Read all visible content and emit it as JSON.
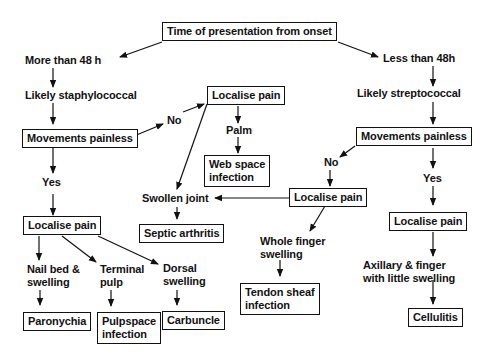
{
  "diagram": {
    "type": "flowchart",
    "title": "Time of presentation from onset",
    "colors": {
      "stroke": "#111111",
      "background": "#ffffff",
      "text": "#111111"
    },
    "nodes": {
      "root": {
        "text": "Time of presentation from onset",
        "boxed": true
      },
      "more48": {
        "text": "More than 48 h",
        "boxed": false
      },
      "staph": {
        "text": "Likely staphylococcal",
        "boxed": false
      },
      "mov_left": {
        "text": "Movements painless",
        "boxed": true
      },
      "no_left": {
        "text": "No",
        "boxed": false
      },
      "loc_mid": {
        "text": "Localise pain",
        "boxed": true
      },
      "palm": {
        "text": "Palm",
        "boxed": false
      },
      "webspace": {
        "line1": "Web space",
        "line2": "infection",
        "boxed": true
      },
      "yes_left": {
        "text": "Yes",
        "boxed": false
      },
      "loc_left": {
        "text": "Localise pain",
        "boxed": true
      },
      "swollen": {
        "text": "Swollen joint",
        "boxed": false
      },
      "septic": {
        "text": "Septic arthritis",
        "boxed": true
      },
      "nailbed": {
        "line1": "Nail bed &",
        "line2": "swelling",
        "boxed": false
      },
      "terminal": {
        "line1": "Terminal",
        "line2": "pulp",
        "boxed": false
      },
      "dorsal": {
        "line1": "Dorsal",
        "line2": "swelling",
        "boxed": false
      },
      "paronychia": {
        "text": "Paronychia",
        "boxed": true
      },
      "pulpspace": {
        "line1": "Pulpspace",
        "line2": "infection",
        "boxed": true
      },
      "carbuncle": {
        "text": "Carbuncle",
        "boxed": true
      },
      "less48": {
        "text": "Less than 48h",
        "boxed": false
      },
      "strep": {
        "text": "Likely streptococcal",
        "boxed": false
      },
      "mov_right": {
        "text": "Movements painless",
        "boxed": true
      },
      "no_right": {
        "text": "No",
        "boxed": false
      },
      "yes_right": {
        "text": "Yes",
        "boxed": false
      },
      "loc_center": {
        "text": "Localise pain",
        "boxed": true
      },
      "wholefinger": {
        "line1": "Whole finger",
        "line2": "swelling",
        "boxed": false
      },
      "tendon": {
        "line1": "Tendon sheaf",
        "line2": "infection",
        "boxed": true
      },
      "loc_right": {
        "text": "Localise pain",
        "boxed": true
      },
      "axillary": {
        "line1": "Axillary & finger",
        "line2": "with little swelling",
        "boxed": false
      },
      "cellulitis": {
        "text": "Cellulitis",
        "boxed": true
      }
    },
    "edges": [
      [
        "root",
        "more48"
      ],
      [
        "root",
        "less48"
      ],
      [
        "more48",
        "staph"
      ],
      [
        "staph",
        "mov_left"
      ],
      [
        "mov_left",
        "no_left"
      ],
      [
        "no_left",
        "loc_mid"
      ],
      [
        "loc_mid",
        "palm"
      ],
      [
        "palm",
        "webspace"
      ],
      [
        "loc_mid",
        "swollen"
      ],
      [
        "mov_left",
        "yes_left"
      ],
      [
        "yes_left",
        "loc_left"
      ],
      [
        "loc_left",
        "nailbed"
      ],
      [
        "loc_left",
        "terminal"
      ],
      [
        "loc_left",
        "dorsal"
      ],
      [
        "nailbed",
        "paronychia"
      ],
      [
        "terminal",
        "pulpspace"
      ],
      [
        "dorsal",
        "carbuncle"
      ],
      [
        "swollen",
        "septic"
      ],
      [
        "less48",
        "strep"
      ],
      [
        "strep",
        "mov_right"
      ],
      [
        "mov_right",
        "no_right"
      ],
      [
        "no_right",
        "loc_center"
      ],
      [
        "loc_center",
        "swollen"
      ],
      [
        "loc_center",
        "wholefinger"
      ],
      [
        "wholefinger",
        "tendon"
      ],
      [
        "mov_right",
        "yes_right"
      ],
      [
        "yes_right",
        "loc_right"
      ],
      [
        "loc_right",
        "axillary"
      ],
      [
        "axillary",
        "cellulitis"
      ]
    ]
  }
}
